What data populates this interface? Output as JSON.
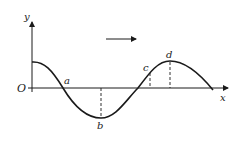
{
  "diagram": {
    "type": "transverse-wave",
    "axes": {
      "x_label": "x",
      "y_label": "y",
      "origin_label": "O"
    },
    "direction_arrow": "right",
    "points": [
      {
        "label": "a",
        "description": "zero crossing (descending)"
      },
      {
        "label": "b",
        "description": "trough"
      },
      {
        "label": "c",
        "description": "rising slope point"
      },
      {
        "label": "d",
        "description": "crest"
      }
    ],
    "colors": {
      "line": "#1a1a1a",
      "background": "#ffffff"
    }
  }
}
